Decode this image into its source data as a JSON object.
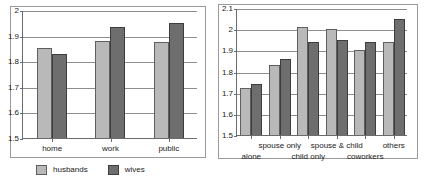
{
  "chart_data": [
    {
      "id": "left",
      "type": "bar",
      "title": "",
      "xlabel": "",
      "ylabel": "",
      "categories": [
        "home",
        "work",
        "public"
      ],
      "series": [
        {
          "name": "husbands",
          "color": "#b9b9b9",
          "values": [
            1.85,
            1.88,
            1.875
          ]
        },
        {
          "name": "wives",
          "color": "#6e6e6e",
          "values": [
            1.83,
            1.935,
            1.95
          ]
        }
      ],
      "ylim": [
        1.5,
        2.0
      ],
      "yticks": [
        1.5,
        1.6,
        1.7,
        1.8,
        1.9,
        2.0
      ],
      "ytick_labels": [
        "1.5",
        "1.6",
        "1.7",
        "1.8",
        "1.9",
        "2"
      ],
      "grid": true,
      "legend_position": "bottom",
      "legend": [
        "husbands",
        "wives"
      ]
    },
    {
      "id": "right",
      "type": "bar",
      "title": "",
      "xlabel": "",
      "ylabel": "",
      "categories": [
        "alone",
        "spouse only",
        "child only",
        "spouse & child",
        "coworkers",
        "others"
      ],
      "series": [
        {
          "name": "husbands",
          "color": "#b9b9b9",
          "values": [
            1.72,
            1.83,
            2.01,
            2.0,
            1.9,
            1.94
          ]
        },
        {
          "name": "wives",
          "color": "#6e6e6e",
          "values": [
            1.74,
            1.86,
            1.94,
            1.95,
            1.94,
            2.05
          ]
        }
      ],
      "ylim": [
        1.5,
        2.1
      ],
      "yticks": [
        1.5,
        1.6,
        1.7,
        1.8,
        1.9,
        2.0,
        2.1
      ],
      "ytick_labels": [
        "1.5",
        "1.6",
        "1.7",
        "1.8",
        "1.9",
        "2",
        "2.1"
      ],
      "grid": true,
      "legend_position": "bottom",
      "legend": [
        "husbands",
        "wives"
      ],
      "xlabel_stagger": true
    }
  ],
  "colors": {
    "husbands": "#b9b9b9",
    "wives": "#6e6e6e",
    "grid": "#8d8d8d",
    "axis": "#6b6b6b",
    "frame": "#9a9a9a",
    "text": "#1a1a1a",
    "background": "#ffffff"
  }
}
